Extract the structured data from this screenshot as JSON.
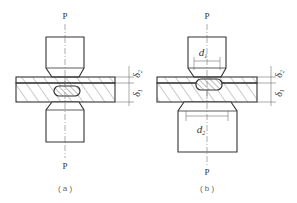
{
  "diagram": {
    "panels": [
      {
        "id": "a",
        "caption": "( a )",
        "force_top": "P",
        "force_bottom": "P",
        "thickness_top": "δ2",
        "thickness_bottom": "δ1"
      },
      {
        "id": "b",
        "caption": "( b )",
        "force_top": "P",
        "force_bottom": "P",
        "diameter_top": "d1",
        "diameter_bottom": "d2",
        "thickness_top": "δ2",
        "thickness_bottom": "δ1"
      }
    ],
    "labels": {
      "p": "P",
      "d": "d",
      "delta": "δ",
      "sub1": "1",
      "sub2": "2",
      "cap_a": "( a )",
      "cap_b": "( b )"
    },
    "colors": {
      "stroke": "#333333",
      "hatch": "#555555",
      "centerline": "#777777",
      "background": "#ffffff"
    }
  }
}
